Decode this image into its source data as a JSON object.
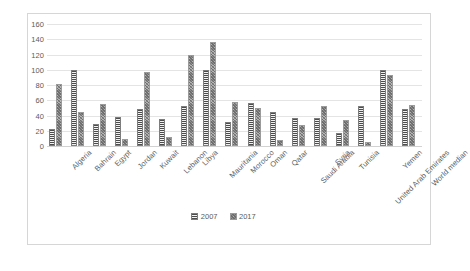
{
  "chart_data": {
    "type": "bar",
    "title": "",
    "subtitle": "",
    "xlabel": "",
    "ylabel": "",
    "ylim": [
      0,
      160
    ],
    "ytick_step": 20,
    "yticks": [
      160,
      140,
      120,
      100,
      80,
      60,
      40,
      20,
      0
    ],
    "grid": true,
    "legend_position": "bottom",
    "categories": [
      "Algeria",
      "Bahrain",
      "Egypt",
      "Jordan",
      "Kuwait",
      "Lebanon",
      "Libya",
      "Mauritania",
      "Morocco",
      "Oman",
      "Qatar",
      "Saudi Arabia",
      "Syria",
      "Tunisia",
      "United Arab Emirates",
      "Yemen",
      "World median"
    ],
    "series": [
      {
        "name": "2007",
        "values": [
          22,
          100,
          29,
          38,
          49,
          35,
          53,
          100,
          32,
          57,
          44,
          37,
          37,
          17,
          52,
          100,
          48
        ]
      },
      {
        "name": "2017",
        "values": [
          81,
          44,
          55,
          9,
          97,
          12,
          119,
          136,
          58,
          50,
          8,
          28,
          53,
          34,
          5,
          93,
          54
        ]
      }
    ]
  },
  "legend": {
    "items": [
      {
        "label": "2007"
      },
      {
        "label": "2017"
      }
    ]
  }
}
